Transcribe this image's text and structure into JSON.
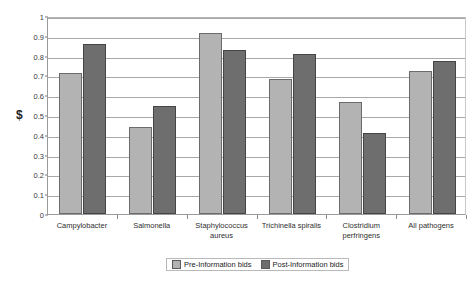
{
  "chart_data": {
    "type": "bar",
    "title": "",
    "xlabel": "",
    "ylabel": "$",
    "ylim": [
      0,
      1
    ],
    "ytick_step": 0.1,
    "grid": true,
    "legend_position": "bottom",
    "categories": [
      "Campylobacter",
      "Salmonella",
      "Staphylococcus aureus",
      "Trichinella spiralis",
      "Clostridium perfringens",
      "All pathogens"
    ],
    "category_lines": [
      [
        "Campylobacter"
      ],
      [
        "Salmonella"
      ],
      [
        "Staphylococcus",
        "aureus"
      ],
      [
        "Trichinella spiralis"
      ],
      [
        "Clostridium",
        "perfringens"
      ],
      [
        "All pathogens"
      ]
    ],
    "series": [
      {
        "name": "Pre-Information bids",
        "color": "#b3b3b3",
        "values": [
          0.71,
          0.44,
          0.915,
          0.68,
          0.565,
          0.72
        ]
      },
      {
        "name": "Post-Information bids",
        "color": "#6e6e6e",
        "values": [
          0.86,
          0.545,
          0.83,
          0.81,
          0.41,
          0.775
        ]
      }
    ],
    "ytick_labels": [
      "0",
      "0.1",
      "0.2",
      "0.3",
      "0.4",
      "0.5",
      "0.6",
      "0.7",
      "0.8",
      "0.9",
      "1"
    ],
    "ytick_values": [
      0,
      0.1,
      0.2,
      0.3,
      0.4,
      0.5,
      0.6,
      0.7,
      0.8,
      0.9,
      1
    ]
  },
  "legend": {
    "items": [
      {
        "label": "Pre-Information bids",
        "swatch": "pre"
      },
      {
        "label": "Post-Information bids",
        "swatch": "post"
      }
    ]
  }
}
